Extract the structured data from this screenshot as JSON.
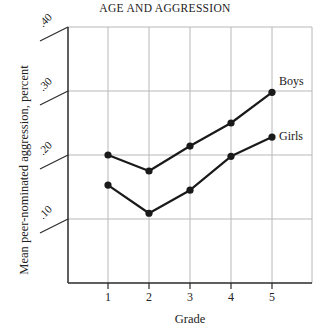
{
  "chart_data": {
    "type": "line",
    "title": "AGE AND AGGRESSION",
    "xlabel": "Grade",
    "ylabel": "Mean peer-nominated aggression, percent",
    "x": [
      1,
      2,
      3,
      4,
      5
    ],
    "x_tick_labels": [
      "1",
      "2",
      "3",
      "4",
      "5"
    ],
    "y_ticks": [
      10,
      20,
      30,
      40
    ],
    "y_tick_labels": [
      ".10",
      ".20",
      ".30",
      ".40"
    ],
    "ylim": [
      0,
      40
    ],
    "grid": true,
    "legend_position": "inline labels at right end of lines",
    "series": [
      {
        "name": "Boys",
        "values": [
          20.0,
          17.5,
          21.4,
          25.0,
          29.8
        ]
      },
      {
        "name": "Girls",
        "values": [
          15.3,
          10.9,
          14.5,
          19.8,
          22.8
        ]
      }
    ],
    "colors": {
      "line": "#1a1a1a",
      "grid": "#b8b8b8",
      "axis": "#2a2a2a"
    }
  },
  "labels": {
    "title": "AGE AND AGGRESSION",
    "xlabel": "Grade",
    "ylabel": "Mean peer-nominated aggression, percent",
    "boys": "Boys",
    "girls": "Girls",
    "xticks": [
      "1",
      "2",
      "3",
      "4",
      "5"
    ],
    "yticks": [
      ".10",
      ".20",
      ".30",
      ".40"
    ]
  }
}
